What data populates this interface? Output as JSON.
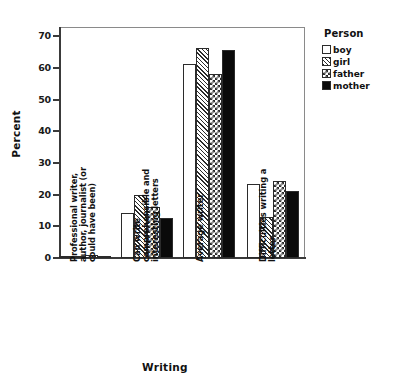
{
  "chart_data": {
    "type": "bar",
    "title": "",
    "xlabel": "Writing",
    "ylabel": "Percent",
    "ylim": [
      0,
      73
    ],
    "yticks": [
      0,
      10,
      20,
      30,
      40,
      50,
      60,
      70
    ],
    "ytick_labels": [
      "0",
      "10",
      "20",
      "30",
      "40",
      "50",
      "60",
      "70"
    ],
    "grid": false,
    "legend_position": "right",
    "legend_title": "Person",
    "categories": [
      "Professional writer, author, journalist (or could have been)",
      "Can write comprehensible and interesting letters",
      "Average writer",
      "Difficulties writing a letter"
    ],
    "series": [
      {
        "name": "boy",
        "pattern": "empty",
        "color": "#ffffff",
        "values": [
          0.7,
          14.2,
          61.2,
          23.4
        ]
      },
      {
        "name": "girl",
        "pattern": "diagonal",
        "color": "#bfbfbf",
        "values": [
          0.4,
          20.0,
          66.3,
          13.0
        ]
      },
      {
        "name": "father",
        "pattern": "checkerboard",
        "color": "#808080",
        "values": [
          0.9,
          16.1,
          58.3,
          24.4
        ]
      },
      {
        "name": "mother",
        "pattern": "solid",
        "color": "#0a0a0a",
        "values": [
          0.3,
          12.6,
          65.7,
          21.1
        ]
      }
    ]
  },
  "axes": {
    "y_title": "Percent",
    "x_title": "Writing",
    "y_tick_labels": [
      "70",
      "60",
      "50",
      "40",
      "30",
      "20",
      "10",
      "0"
    ]
  },
  "legend": {
    "title": "Person",
    "items": [
      {
        "label": "boy"
      },
      {
        "label": "girl"
      },
      {
        "label": "father"
      },
      {
        "label": "mother"
      }
    ]
  },
  "categories": [
    {
      "label": "Professional writer,\nauthor, journalist (or\ncould have been)"
    },
    {
      "label": "Can write\ncomprehensible and\ninteresting letters"
    },
    {
      "label": "Average writer"
    },
    {
      "label": "Difficulties writing a\nletter"
    }
  ]
}
